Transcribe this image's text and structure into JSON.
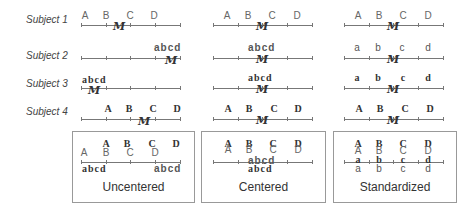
{
  "subjects": [
    {
      "label": "Subject 1",
      "upper": [
        "A",
        "B",
        "C",
        "D"
      ],
      "mean_symbol": "M"
    },
    {
      "label": "Subject 2",
      "lower": "abcd",
      "mean_symbol": "M"
    },
    {
      "label": "Subject 3",
      "lower": "abcd",
      "mean_symbol": "M"
    },
    {
      "label": "Subject 4",
      "upper": [
        "A",
        "B",
        "C",
        "D"
      ],
      "mean_symbol": "M"
    }
  ],
  "columns": {
    "uncentered": {
      "title": "Uncentered",
      "row1_upper": [
        "A",
        "B",
        "C",
        "D"
      ],
      "row2_lower": "abcd",
      "row3_lower": "abcd",
      "row4_upper": [
        "A",
        "B",
        "C",
        "D"
      ]
    },
    "centered": {
      "title": "Centered",
      "row1_upper": [
        "A",
        "B",
        "C",
        "D"
      ],
      "row2_lower": "abcd",
      "row3_lower": "abcd",
      "row4_upper": [
        "A",
        "B",
        "C",
        "D"
      ]
    },
    "standardized": {
      "title": "Standardized",
      "row1_upper": [
        "A",
        "B",
        "C",
        "D"
      ],
      "row2_lower": [
        "a",
        "b",
        "c",
        "d"
      ],
      "row3_lower": [
        "a",
        "b",
        "c",
        "d"
      ],
      "row4_upper": [
        "A",
        "B",
        "C",
        "D"
      ]
    }
  },
  "panels": {
    "uncentered": {
      "title": "Uncentered",
      "upper_sans": [
        "A",
        "B",
        "C",
        "D"
      ],
      "upper_serif": [
        "A",
        "B",
        "C",
        "D"
      ],
      "lower_left": "abcd",
      "lower_right": "abcd"
    },
    "centered": {
      "title": "Centered",
      "upper_sans": [
        "A",
        "B",
        "C",
        "D"
      ],
      "upper_serif": [
        "A",
        "B",
        "C",
        "D"
      ],
      "lower_sans": "abcd",
      "lower_serif": "abcd"
    },
    "standardized": {
      "title": "Standardized",
      "upper_sans": [
        "A",
        "B",
        "C",
        "D"
      ],
      "upper_serif": [
        "A",
        "B",
        "C",
        "D"
      ],
      "lower_sans": [
        "a",
        "b",
        "c",
        "d"
      ],
      "lower_serif": [
        "a",
        "b",
        "c",
        "d"
      ]
    }
  },
  "mean_glyph": "M"
}
